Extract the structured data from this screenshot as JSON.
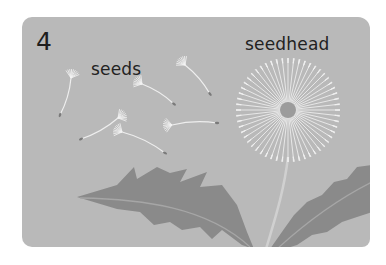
{
  "figure": {
    "number": "4",
    "labels": {
      "seeds": "seeds",
      "seedhead": "seedhead"
    },
    "colors": {
      "background": "#b9b9b9",
      "leaf": "#8a8a8a",
      "seed": "#f2f2f2",
      "text": "#222222"
    },
    "illustration": "dandelion-with-seeds-icon"
  }
}
